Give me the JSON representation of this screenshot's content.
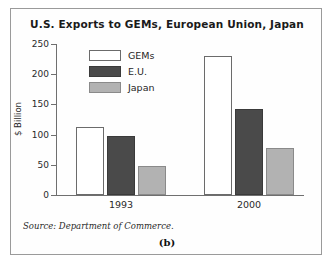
{
  "figure": {
    "label": "(b)",
    "source_note": "Source: Department of Commerce."
  },
  "chart_data": {
    "type": "bar",
    "title": "U.S. Exports to GEMs, European Union, Japan",
    "xlabel": "",
    "ylabel": "$ Billion",
    "categories": [
      "1993",
      "2000"
    ],
    "series": [
      {
        "name": "GEMs",
        "values": [
          112,
          230
        ],
        "color": "#ffffff"
      },
      {
        "name": "E.U.",
        "values": [
          97,
          142
        ],
        "color": "#4a4a4a"
      },
      {
        "name": "Japan",
        "values": [
          48,
          78
        ],
        "color": "#b2b2b2"
      }
    ],
    "ylim": [
      0,
      250
    ],
    "yticks": [
      0,
      50,
      100,
      150,
      200,
      250
    ],
    "ytick_labels": [
      "0",
      "50",
      "100",
      "150",
      "200",
      "250"
    ],
    "grid": false,
    "legend_position": "top-left-inside"
  }
}
